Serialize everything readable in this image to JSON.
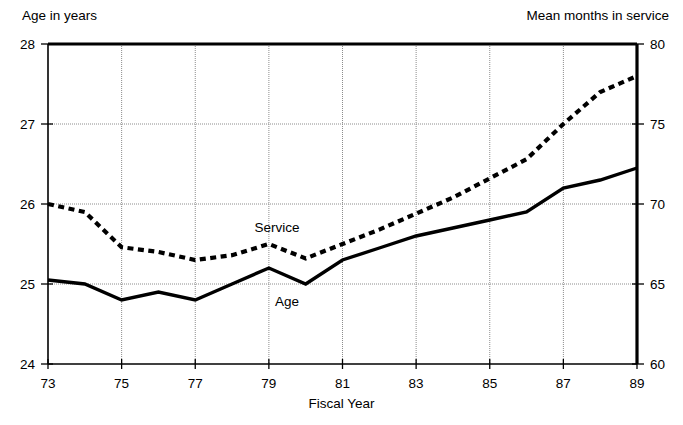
{
  "figure": {
    "title_remnant": "",
    "left_axis_title": "Age in years",
    "right_axis_title": "Mean months in service",
    "xlabel": "Fiscal Year",
    "label_service": "Service",
    "label_age": "Age",
    "line_color": "#000000",
    "grid_color": "#8c8c8c",
    "axis_color": "#000000",
    "background": "#ffffff"
  },
  "chart_data": {
    "type": "line",
    "title": "",
    "xlabel": "Fiscal Year",
    "ylabel": "Age in years",
    "y2label": "Mean months in service",
    "xlim": [
      73,
      89
    ],
    "ylim": [
      24,
      28
    ],
    "y2lim": [
      60,
      80
    ],
    "grid": true,
    "legend": "inline-annotations",
    "xticks": [
      73,
      75,
      77,
      79,
      81,
      83,
      85,
      87,
      89
    ],
    "xtick_labels": [
      "73",
      "75",
      "77",
      "79",
      "81",
      "83",
      "85",
      "87",
      "89"
    ],
    "yticks": [
      24,
      25,
      26,
      27,
      28
    ],
    "ytick_labels": [
      "24",
      "25",
      "26",
      "27",
      "28"
    ],
    "y2ticks": [
      60,
      65,
      70,
      75,
      80
    ],
    "y2tick_labels": [
      "60",
      "65",
      "70",
      "75",
      "80"
    ],
    "x": [
      73,
      74,
      75,
      76,
      77,
      78,
      79,
      80,
      81,
      82,
      83,
      84,
      85,
      86,
      87,
      88,
      89
    ],
    "series": [
      {
        "name": "Age",
        "axis": "left",
        "units": "years",
        "style": "solid",
        "values": [
          25.05,
          25.0,
          24.8,
          24.9,
          24.8,
          25.0,
          25.2,
          25.0,
          25.3,
          25.45,
          25.6,
          25.7,
          25.8,
          25.9,
          26.2,
          26.3,
          26.45
        ]
      },
      {
        "name": "Service",
        "axis": "right",
        "units": "months",
        "style": "dashed",
        "values": [
          70.0,
          69.5,
          67.3,
          67.0,
          66.5,
          66.8,
          67.5,
          66.6,
          67.5,
          68.4,
          69.4,
          70.4,
          71.6,
          72.8,
          75.0,
          77.0,
          78.0
        ]
      }
    ]
  }
}
